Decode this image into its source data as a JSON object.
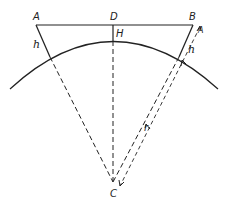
{
  "diagram": {
    "title": "",
    "points": {
      "A": "A",
      "B": "B",
      "D": "D",
      "H": "H",
      "C": "C"
    },
    "labels": {
      "h_left": "h",
      "h_right": "h",
      "r": "r",
      "arrow_end": "A"
    },
    "colors": {
      "line": "#222222",
      "background": "#ffffff"
    }
  }
}
